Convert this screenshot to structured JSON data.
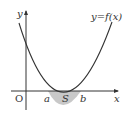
{
  "diagram": {
    "curve_label": "y=f(x)",
    "origin_label": "O",
    "x_axis_label": "x",
    "y_axis_label": "y",
    "root_a_label": "a",
    "root_b_label": "b",
    "area_label": "S",
    "colors": {
      "line": "#333333",
      "shade": "#c8c8c8"
    }
  }
}
